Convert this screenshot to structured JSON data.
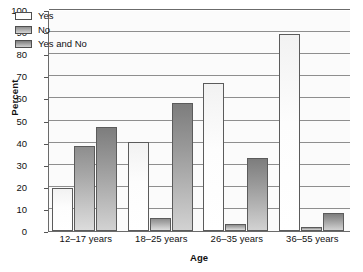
{
  "chart_data": {
    "type": "bar",
    "title": "",
    "xlabel": "Age",
    "ylabel": "Percent",
    "categories": [
      "12–17 years",
      "18–25 years",
      "26–35 years",
      "36–55 years"
    ],
    "series": [
      {
        "name": "Yes",
        "values": [
          19.5,
          40.5,
          67.0,
          89.0
        ]
      },
      {
        "name": "No",
        "values": [
          38.5,
          6.0,
          3.0,
          2.0
        ]
      },
      {
        "name": "Yes and No",
        "values": [
          47.0,
          58.0,
          33.0,
          8.0
        ]
      }
    ],
    "ylim": [
      0,
      100
    ],
    "yticks": [
      0,
      10,
      20,
      30,
      40,
      50,
      60,
      70,
      80,
      90,
      100
    ],
    "ytick_labels": [
      "0",
      "10",
      "20",
      "30",
      "40",
      "50",
      "60",
      "70",
      "80",
      "90",
      "100"
    ],
    "grid": true,
    "legend_position": "upper left",
    "colors": {
      "Yes": "#ffffff",
      "No": "#a8a8a8",
      "Yes and No": "#999999",
      "axis": "#6b6b6b",
      "gridline": "#8e8e8e",
      "text": "#111111",
      "plot_background": "#fbfbfb"
    }
  },
  "legend": {
    "items": [
      {
        "label": "Yes"
      },
      {
        "label": "No"
      },
      {
        "label": "Yes and No"
      }
    ]
  },
  "axes": {
    "y_title": "Percent",
    "x_title": "Age"
  }
}
